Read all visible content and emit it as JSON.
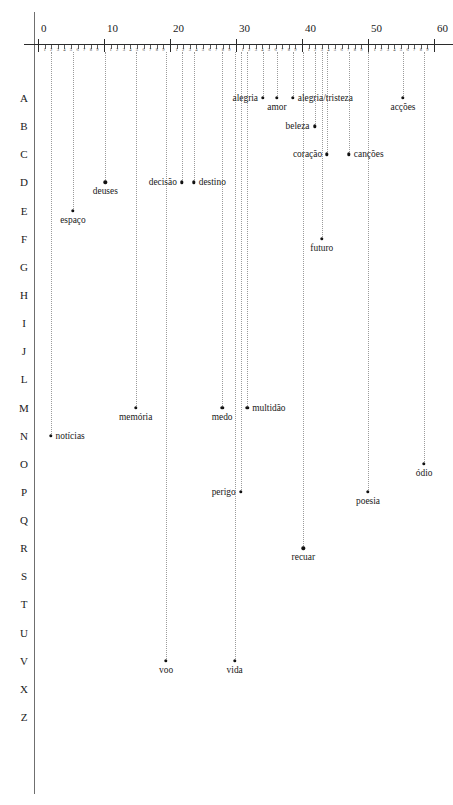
{
  "figure": {
    "type": "dispersion-scatter",
    "axis_label_font_note": "",
    "x_axis": {
      "min": 0,
      "max": 60,
      "major_ticks": [
        0,
        10,
        20,
        30,
        40,
        50,
        60
      ],
      "major_tick_labels": [
        "0",
        "10",
        "20",
        "30",
        "40",
        "50",
        "60"
      ],
      "minor_tick_labels": [
        "1",
        "2",
        "3",
        "4",
        "5",
        "6",
        "7",
        "8",
        "9"
      ],
      "position": "top"
    },
    "y_axis": {
      "categories": [
        "A",
        "B",
        "C",
        "D",
        "E",
        "F",
        "G",
        "H",
        "I",
        "J",
        "L",
        "M",
        "N",
        "O",
        "P",
        "Q",
        "R",
        "S",
        "T",
        "U",
        "V",
        "X",
        "Z"
      ],
      "note": "Portuguese alphabet rows (no K, W, Y)"
    },
    "colors": {
      "point": "#111111",
      "guide_line": "#9b9b9b",
      "axis": "#2b2b2b",
      "frame": "#6f6f6f",
      "text": "#1a1a1a",
      "background": "#ffffff"
    }
  },
  "chart_data": {
    "type": "scatter",
    "title": "",
    "xlabel": "",
    "ylabel": "",
    "xlim": [
      0,
      60
    ],
    "grid": false,
    "legend": null,
    "categories": [
      "A",
      "B",
      "C",
      "D",
      "E",
      "F",
      "G",
      "H",
      "I",
      "J",
      "L",
      "M",
      "N",
      "O",
      "P",
      "Q",
      "R",
      "S",
      "T",
      "U",
      "V",
      "X",
      "Z"
    ],
    "points": [
      {
        "label": "alegria",
        "row": "A",
        "x": 34.1,
        "label_side": "left"
      },
      {
        "label": "amor",
        "row": "A",
        "x": 36.2,
        "label_side": "below"
      },
      {
        "label": "alegria/tristeza",
        "row": "A",
        "x": 38.6,
        "label_side": "right"
      },
      {
        "label": "acções",
        "row": "A",
        "x": 55.3,
        "label_side": "below"
      },
      {
        "label": "beleza",
        "row": "B",
        "x": 41.9,
        "label_side": "left"
      },
      {
        "label": "coração",
        "row": "C",
        "x": 43.8,
        "label_side": "left"
      },
      {
        "label": "canções",
        "row": "C",
        "x": 47.1,
        "label_side": "right"
      },
      {
        "label": "deuses",
        "row": "D",
        "x": 10.2,
        "label_side": "below"
      },
      {
        "label": "decisão",
        "row": "D",
        "x": 21.8,
        "label_side": "left"
      },
      {
        "label": "destino",
        "row": "D",
        "x": 23.6,
        "label_side": "right"
      },
      {
        "label": "espaço",
        "row": "E",
        "x": 5.3,
        "label_side": "below"
      },
      {
        "label": "futuro",
        "row": "F",
        "x": 43.0,
        "label_side": "below"
      },
      {
        "label": "memória",
        "row": "M",
        "x": 14.8,
        "label_side": "below"
      },
      {
        "label": "medo",
        "row": "M",
        "x": 27.9,
        "label_side": "below"
      },
      {
        "label": "multidão",
        "row": "M",
        "x": 31.7,
        "label_side": "right"
      },
      {
        "label": "notícias",
        "row": "N",
        "x": 1.9,
        "label_side": "right"
      },
      {
        "label": "ódio",
        "row": "O",
        "x": 58.5,
        "label_side": "below"
      },
      {
        "label": "perigo",
        "row": "P",
        "x": 30.7,
        "label_side": "left"
      },
      {
        "label": "poesia",
        "row": "P",
        "x": 50.0,
        "label_side": "below"
      },
      {
        "label": "recuar",
        "row": "R",
        "x": 40.2,
        "label_side": "below"
      },
      {
        "label": "voo",
        "row": "V",
        "x": 19.4,
        "label_side": "below"
      },
      {
        "label": "vida",
        "row": "V",
        "x": 29.8,
        "label_side": "below"
      }
    ]
  }
}
